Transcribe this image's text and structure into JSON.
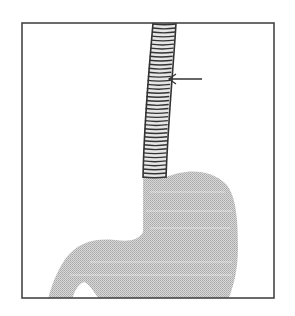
{
  "figure": {
    "type": "medical-illustration",
    "frame": {
      "x": 22,
      "y": 23,
      "width": 252,
      "height": 275,
      "stroke": "#3a3a3a"
    },
    "stent": {
      "fill": "#ffffff",
      "ring_color": "#333333",
      "ring_count": 38
    },
    "stomach": {
      "fill": "#c9c9c9"
    },
    "arrow": {
      "color": "#333333",
      "points_to": "stent",
      "tip": [
        168,
        79
      ],
      "tail": [
        202,
        79
      ]
    }
  }
}
